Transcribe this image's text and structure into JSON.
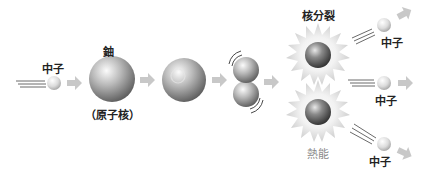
{
  "labels": {
    "neutron_in": "中子",
    "uranium": "鈾",
    "nucleus": "（原子核）",
    "fission": "核分裂",
    "heat": "熱能",
    "neutron_out_1": "中子",
    "neutron_out_2": "中子",
    "neutron_out_3": "中子"
  },
  "colors": {
    "arrow": "#c8c8c8",
    "sphere_light": "#f4f4f4",
    "sphere_dark": "#6e6e6e",
    "text": "#222222",
    "heat_text": "#8a8a8a"
  }
}
